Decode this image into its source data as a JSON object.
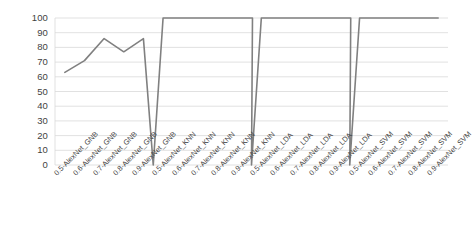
{
  "chart_data": {
    "type": "line",
    "title": "",
    "xlabel": "",
    "ylabel": "",
    "ylim": [
      0,
      100
    ],
    "yticks": [
      0,
      10,
      20,
      30,
      40,
      50,
      60,
      70,
      80,
      90,
      100
    ],
    "grid": true,
    "legend": "none",
    "line_color": "#808080",
    "categories": [
      "0.5-AlexNet_GNB",
      "0.6-AlexNet_GNB",
      "0.7-AlexNet_GNB",
      "0.8-AlexNet_GNB",
      "0.9-AlexNet_GNB",
      "0.5-AlexNet_KNN",
      "0.6-AlexNet_KNN",
      "0.7-AlexNet_KNN",
      "0.8-AlexNet_KNN",
      "0.9-AlexNet_KNN",
      "0.5-AlexNet_LDA",
      "0.6-AlexNet_LDA",
      "0.7-AlexNet_LDA",
      "0.8-AlexNet_LDA",
      "0.9-AlexNet_LDA",
      "0.5-AlexNet_SVM",
      "0.6-AlexNet_SVM",
      "0.7-AlexNet_SVM",
      "0.8-AlexNet_SVM",
      "0.9-AlexNet_SVM"
    ],
    "values": [
      63,
      71,
      86,
      77,
      86,
      100,
      100,
      100,
      100,
      100,
      100,
      100,
      100,
      100,
      100,
      100,
      100,
      100,
      100,
      100
    ],
    "groups": [
      {
        "name": "GNB",
        "values": [
          63,
          71,
          86,
          77,
          86
        ]
      },
      {
        "name": "KNN",
        "values": [
          100,
          100,
          100,
          100,
          100
        ]
      },
      {
        "name": "LDA",
        "values": [
          100,
          100,
          100,
          100,
          100
        ]
      },
      {
        "name": "SVM",
        "values": [
          100,
          100,
          100,
          100,
          100
        ]
      }
    ],
    "gap_value": 0
  }
}
